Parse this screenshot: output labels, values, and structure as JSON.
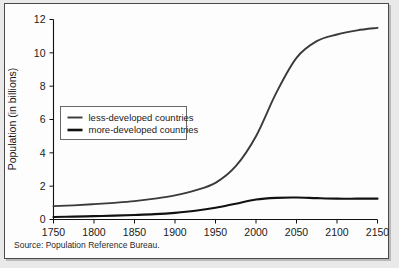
{
  "figure": {
    "source_note": "Source: Population Reference Bureau.",
    "background_color": "#e9e9e9",
    "panel_color": "#fdfdfd",
    "border_color": "#4a4a4a"
  },
  "chart_data": {
    "type": "line",
    "title": "",
    "xlabel": "",
    "ylabel": "Population (in billions)",
    "xlim": [
      1750,
      2150
    ],
    "ylim": [
      0,
      12
    ],
    "grid": false,
    "legend_position": "upper-left-inside",
    "xticks": [
      1750,
      1800,
      1850,
      1900,
      1950,
      2000,
      2050,
      2100,
      2150
    ],
    "xticklabels": [
      "1750",
      "1800",
      "1850",
      "1900",
      "1950",
      "2000",
      "2050",
      "2100",
      "2150"
    ],
    "yticks": [
      0,
      2,
      4,
      6,
      8,
      10,
      12
    ],
    "yticklabels": [
      "0",
      "2",
      "4",
      "6",
      "8",
      "10",
      "12"
    ],
    "x": [
      1750,
      1775,
      1800,
      1825,
      1850,
      1875,
      1900,
      1925,
      1950,
      1975,
      2000,
      2025,
      2050,
      2075,
      2100,
      2125,
      2150
    ],
    "series": [
      {
        "name": "less-developed countries",
        "color": "#3a3a3a",
        "width": 1.9,
        "values": [
          0.8,
          0.85,
          0.92,
          1.0,
          1.1,
          1.25,
          1.45,
          1.75,
          2.2,
          3.2,
          5.0,
          7.6,
          9.7,
          10.7,
          11.1,
          11.35,
          11.5
        ]
      },
      {
        "name": "more-developed countries",
        "color": "#111111",
        "width": 2.1,
        "values": [
          0.15,
          0.17,
          0.2,
          0.23,
          0.27,
          0.32,
          0.4,
          0.52,
          0.7,
          0.95,
          1.2,
          1.3,
          1.32,
          1.28,
          1.25,
          1.25,
          1.25
        ]
      }
    ],
    "legend": [
      {
        "label": "less-developed countries",
        "color": "#3a3a3a",
        "width": 1.9
      },
      {
        "label": "more-developed countries",
        "color": "#111111",
        "width": 2.6
      }
    ]
  }
}
